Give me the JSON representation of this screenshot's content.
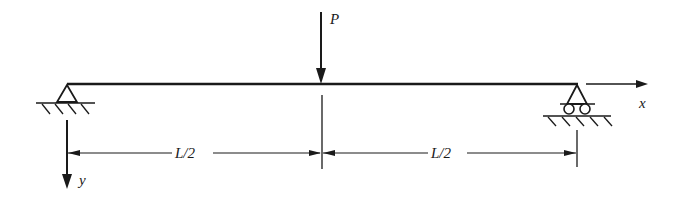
{
  "diagram": {
    "type": "simply-supported-beam",
    "colors": {
      "stroke": "#1a1a1a",
      "background": "#ffffff"
    },
    "load": {
      "label": "P",
      "position": "midspan",
      "direction": "down"
    },
    "supports": {
      "left": {
        "type": "pin"
      },
      "right": {
        "type": "roller"
      }
    },
    "axes": {
      "x": {
        "label": "x",
        "direction": "right"
      },
      "y": {
        "label": "y",
        "direction": "down"
      }
    },
    "dimensions": [
      {
        "label": "L/2",
        "from": "left-support",
        "to": "midspan"
      },
      {
        "label": "L/2",
        "from": "midspan",
        "to": "right-support"
      }
    ]
  }
}
